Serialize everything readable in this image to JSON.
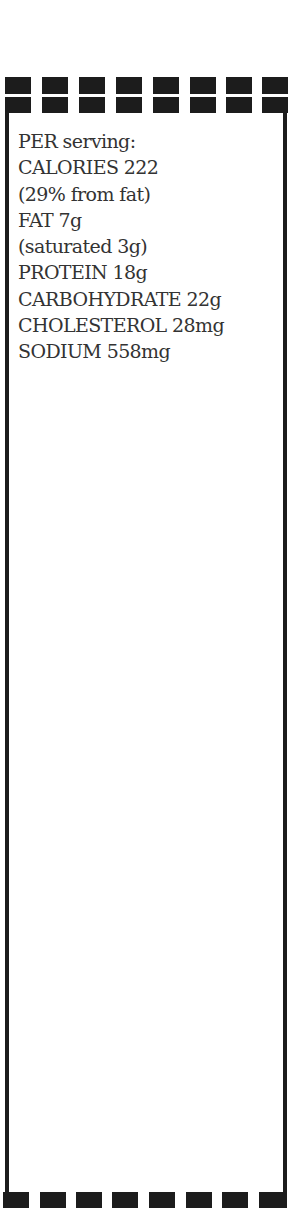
{
  "nutrition": {
    "header": "PER serving:",
    "lines": [
      "CALORIES 222",
      "(29% from fat)",
      "FAT 7g",
      "(saturated 3g)",
      "PROTEIN 18g",
      "CARBOHYDRATE 22g",
      "CHOLESTEROL 28mg",
      "SODIUM 558mg"
    ]
  },
  "colors": {
    "border": "#1c1c1c",
    "text": "#333333",
    "background": "#ffffff"
  }
}
